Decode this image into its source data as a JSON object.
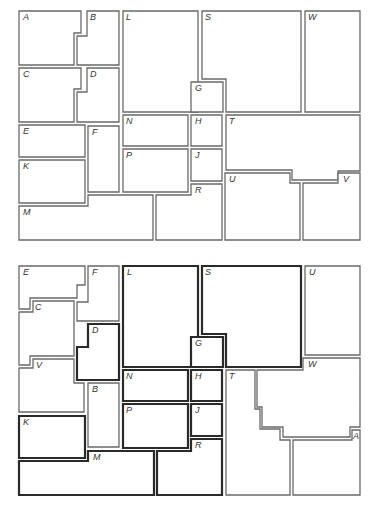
{
  "figure": {
    "colors": {
      "background": "#ffffff",
      "thin_border": "#6a6a6a",
      "thick_border": "#2a2a2a"
    }
  },
  "top_panel": {
    "labels": [
      "A",
      "B",
      "L",
      "S",
      "W",
      "C",
      "D",
      "G",
      "N",
      "H",
      "T",
      "E",
      "F",
      "P",
      "J",
      "K",
      "R",
      "U",
      "V",
      "M"
    ],
    "pieces": [
      {
        "label": "A",
        "points": "19,11 81,11 81,33 74,33 74,65 19,65",
        "lx": 23,
        "ly": 20,
        "thick": false
      },
      {
        "label": "B",
        "points": "87,11 119,11 119,65 77,65 77,36 87,36",
        "lx": 90,
        "ly": 20,
        "thick": false
      },
      {
        "label": "L",
        "points": "123,11 198,11 198,112 123,112",
        "lx": 126,
        "ly": 20,
        "thick": false
      },
      {
        "label": "S",
        "points": "202,11 301,11 301,112 226,112 226,79 202,79",
        "lx": 205,
        "ly": 20,
        "thick": false
      },
      {
        "label": "W",
        "points": "305,11 360,11 360,112 305,112",
        "lx": 308,
        "ly": 20,
        "thick": false
      },
      {
        "label": "C",
        "points": "19,68 81,68 81,89 74,89 74,122 19,122",
        "lx": 23,
        "ly": 77,
        "thick": false
      },
      {
        "label": "D",
        "points": "87,68 119,68 119,122 77,122 77,92 87,92",
        "lx": 90,
        "ly": 77,
        "thick": false
      },
      {
        "label": "G",
        "points": "191,82 223,82 223,112 191,112",
        "lx": 195,
        "ly": 91,
        "thick": false
      },
      {
        "label": "N",
        "points": "123,115 188,115 188,146 123,146",
        "lx": 126,
        "ly": 124,
        "thick": false
      },
      {
        "label": "H",
        "points": "191,115 222,115 222,146 191,146",
        "lx": 195,
        "ly": 124,
        "thick": false
      },
      {
        "label": "T",
        "points": "226,115 360,115 360,171 338,171 338,180 292,180 292,170 226,170",
        "lx": 229,
        "ly": 124,
        "thick": false
      },
      {
        "label": "E",
        "points": "19,125 85,125 85,157 19,157",
        "lx": 23,
        "ly": 134,
        "thick": false
      },
      {
        "label": "F",
        "points": "88,126 119,126 119,192 88,192",
        "lx": 92,
        "ly": 135,
        "thick": false
      },
      {
        "label": "P",
        "points": "123,149 188,149 188,192 123,192",
        "lx": 126,
        "ly": 158,
        "thick": false
      },
      {
        "label": "J",
        "points": "191,149 222,149 222,181 191,181",
        "lx": 195,
        "ly": 158,
        "thick": false
      },
      {
        "label": "K",
        "points": "19,160 85,160 85,203 19,203",
        "lx": 23,
        "ly": 169,
        "thick": false
      },
      {
        "label": "U",
        "points": "225,173 290,173 290,183 300,183 300,240 225,240",
        "lx": 229,
        "ly": 182,
        "thick": false
      },
      {
        "label": "R",
        "points": "191,184 222,184 222,240 156,240 156,195 191,195",
        "lx": 195,
        "ly": 193,
        "thick": false
      },
      {
        "label": "V",
        "points": "338,173 360,173 360,240 303,240 303,183 338,183",
        "lx": 343,
        "ly": 182,
        "thick": false
      },
      {
        "label": "M",
        "points": "19,206 88,206 88,195 153,195 153,240 19,240",
        "lx": 23,
        "ly": 215,
        "thick": false
      }
    ]
  },
  "bottom_panel": {
    "labels": [
      "E",
      "F",
      "L",
      "S",
      "U",
      "C",
      "D",
      "G",
      "W",
      "V",
      "N",
      "H",
      "T",
      "B",
      "P",
      "J",
      "A",
      "K",
      "R",
      "M"
    ],
    "pieces": [
      {
        "label": "E",
        "points": "19,266 85,266 85,285 77,285 77,298 30,298 30,309 19,309",
        "lx": 23,
        "ly": 275,
        "thick": false
      },
      {
        "label": "F",
        "points": "88,266 119,266 119,321 77,321 77,302 88,302 88,290",
        "lx": 92,
        "ly": 275,
        "thick": false
      },
      {
        "label": "C",
        "points": "33,301 74,301 74,356 30,356 30,365 19,365 19,312 33,312",
        "lx": 35,
        "ly": 310,
        "thick": false
      },
      {
        "label": "L",
        "points": "123,266 198,266 198,367 123,367",
        "lx": 127,
        "ly": 275,
        "thick": true
      },
      {
        "label": "S",
        "points": "202,266 301,266 301,367 226,367 226,334 202,334",
        "lx": 205,
        "ly": 275,
        "thick": true
      },
      {
        "label": "U",
        "points": "305,266 360,266 360,355 305,355",
        "lx": 309,
        "ly": 275,
        "thick": false
      },
      {
        "label": "D",
        "points": "88,324 119,324 119,380 77,380 77,347 88,347",
        "lx": 92,
        "ly": 333,
        "thick": true
      },
      {
        "label": "G",
        "points": "191,337 223,337 223,367 191,367",
        "lx": 195,
        "ly": 346,
        "thick": true
      },
      {
        "label": "W",
        "points": "303,358 360,358 360,427 350,427 350,437 283,437 283,427 262,427 262,407 257,407 257,370 303,370",
        "lx": 308,
        "ly": 367,
        "thick": false
      },
      {
        "label": "V",
        "points": "33,359 74,359 74,383 84,383 84,412 19,412 19,368 33,368",
        "lx": 36,
        "ly": 368,
        "thick": false
      },
      {
        "label": "N",
        "points": "123,370 188,370 188,401 123,401",
        "lx": 126,
        "ly": 379,
        "thick": true
      },
      {
        "label": "H",
        "points": "191,370 222,370 222,401 191,401",
        "lx": 195,
        "ly": 379,
        "thick": true
      },
      {
        "label": "T",
        "points": "226,370 255,370 255,409 260,409 260,429 280,429 280,440 290,440 290,495 226,495",
        "lx": 229,
        "ly": 379,
        "thick": false
      },
      {
        "label": "B",
        "points": "88,383 119,383 119,447 88,447",
        "lx": 92,
        "ly": 392,
        "thick": false
      },
      {
        "label": "P",
        "points": "123,404 188,404 188,448 123,448",
        "lx": 126,
        "ly": 413,
        "thick": true
      },
      {
        "label": "J",
        "points": "191,404 222,404 222,436 191,436",
        "lx": 195,
        "ly": 413,
        "thick": true
      },
      {
        "label": "A",
        "points": "352,430 360,430 360,495 293,495 293,440 352,440",
        "lx": 353,
        "ly": 439,
        "thick": false
      },
      {
        "label": "K",
        "points": "19,416 85,416 85,458 19,458",
        "lx": 23,
        "ly": 425,
        "thick": true
      },
      {
        "label": "R",
        "points": "191,439 222,439 222,495 157,495 157,451 191,451",
        "lx": 195,
        "ly": 448,
        "thick": true
      },
      {
        "label": "M",
        "points": "19,461 88,461 88,451 154,451 154,495 19,495",
        "lx": 93,
        "ly": 460,
        "thick": true
      }
    ]
  }
}
